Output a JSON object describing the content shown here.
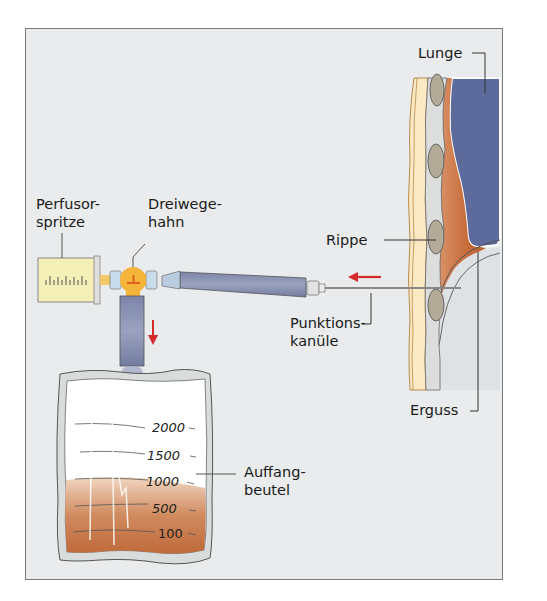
{
  "figure": {
    "labels": {
      "lunge": "Lunge",
      "perfusor_line1": "Perfusor-",
      "perfusor_line2": "spritze",
      "dreiwege_line1": "Dreiwege-",
      "dreiwege_line2": "hahn",
      "rippe": "Rippe",
      "punktion_line1": "Punktions-",
      "punktion_line2": "kanüle",
      "erguss": "Erguss",
      "auffang_line1": "Auffang-",
      "auffang_line2": "beutel"
    },
    "bag_scale": [
      "2000",
      "1500",
      "1000",
      "500",
      "100"
    ],
    "colors": {
      "background": "#e9ebec",
      "lung": "#5d6a9c",
      "effusion": "#c9703e",
      "chest_wall": "#fbe9c4",
      "rib": "#b3ab98",
      "tube": "#8e96b4",
      "valve": "#f4b43a",
      "syringe": "#f5efb8",
      "arrow": "#d32a2a",
      "bag_fluid": "#c47a4e"
    }
  }
}
